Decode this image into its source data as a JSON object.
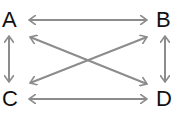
{
  "diagram": {
    "nodes": [
      {
        "id": "A",
        "label": "A"
      },
      {
        "id": "B",
        "label": "B"
      },
      {
        "id": "C",
        "label": "C"
      },
      {
        "id": "D",
        "label": "D"
      }
    ],
    "edges": [
      {
        "from": "A",
        "to": "B",
        "type": "bidirectional"
      },
      {
        "from": "C",
        "to": "D",
        "type": "bidirectional"
      },
      {
        "from": "A",
        "to": "C",
        "type": "bidirectional"
      },
      {
        "from": "B",
        "to": "D",
        "type": "bidirectional"
      },
      {
        "from": "A",
        "to": "D",
        "type": "bidirectional"
      },
      {
        "from": "C",
        "to": "B",
        "type": "bidirectional"
      }
    ],
    "arrow_color": "#8c8c8c"
  }
}
